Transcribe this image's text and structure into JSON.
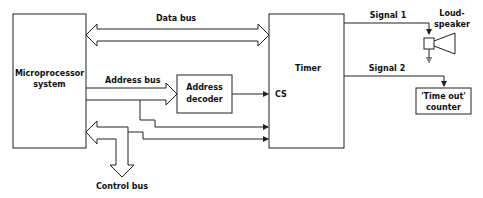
{
  "diagram": {
    "blocks": {
      "microprocessor": {
        "line1": "Microprocessor",
        "line2": "system"
      },
      "timer": {
        "label": "Timer",
        "cs": "CS"
      },
      "address_decoder": {
        "line1": "Address",
        "line2": "decoder"
      },
      "timeout_counter": {
        "line1": "'Time out'",
        "line2": "counter"
      },
      "loudspeaker": {
        "line1": "Loud-",
        "line2": "speaker"
      }
    },
    "buses": {
      "data": "Data bus",
      "address": "Address bus",
      "control": "Control bus"
    },
    "signals": {
      "signal1": "Signal 1",
      "signal2": "Signal 2"
    },
    "colors": {
      "line": "#222222",
      "background": "#ffffff"
    }
  }
}
